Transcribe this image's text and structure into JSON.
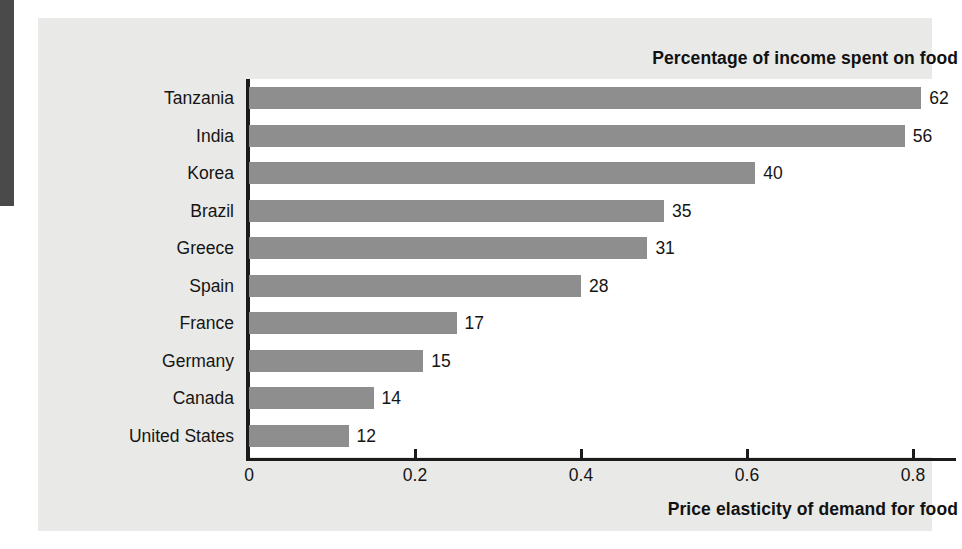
{
  "figure": {
    "header_title": "Percentage of income spent on food",
    "x_axis_title": "Price elasticity of demand for food"
  },
  "colors": {
    "bar": "#8e8e8e",
    "card_background": "#e9e9e7",
    "plot_background": "#ffffff",
    "axis": "#1b1b1b",
    "text": "#151515",
    "gutter_band": "#4a4a4a"
  },
  "chart_data": {
    "type": "bar",
    "orientation": "horizontal",
    "title": "Percentage of income spent on food",
    "xlabel": "Price elasticity of demand for food",
    "ylabel": "",
    "xlim": [
      0,
      0.88
    ],
    "grid": false,
    "legend": "none",
    "categories": [
      "Tanzania",
      "India",
      "Korea",
      "Brazil",
      "Greece",
      "Spain",
      "France",
      "Germany",
      "Canada",
      "United States"
    ],
    "series": [
      {
        "name": "Price elasticity of demand for food",
        "values": [
          0.81,
          0.79,
          0.61,
          0.5,
          0.48,
          0.4,
          0.25,
          0.21,
          0.15,
          0.12
        ]
      }
    ],
    "data_labels": [
      "62",
      "56",
      "40",
      "35",
      "31",
      "28",
      "17",
      "15",
      "14",
      "12"
    ],
    "data_label_meaning": "Percentage of income spent on food",
    "xticks": [
      0,
      0.2,
      0.4,
      0.6,
      0.8
    ],
    "xticklabels": [
      "0",
      "0.2",
      "0.4",
      "0.6",
      "0.8"
    ],
    "rows": [
      {
        "category": "Tanzania",
        "elasticity": 0.81,
        "percent_label": "62"
      },
      {
        "category": "India",
        "elasticity": 0.79,
        "percent_label": "56"
      },
      {
        "category": "Korea",
        "elasticity": 0.61,
        "percent_label": "40"
      },
      {
        "category": "Brazil",
        "elasticity": 0.5,
        "percent_label": "35"
      },
      {
        "category": "Greece",
        "elasticity": 0.48,
        "percent_label": "31"
      },
      {
        "category": "Spain",
        "elasticity": 0.4,
        "percent_label": "28"
      },
      {
        "category": "France",
        "elasticity": 0.25,
        "percent_label": "17"
      },
      {
        "category": "Germany",
        "elasticity": 0.21,
        "percent_label": "15"
      },
      {
        "category": "Canada",
        "elasticity": 0.15,
        "percent_label": "14"
      },
      {
        "category": "United States",
        "elasticity": 0.12,
        "percent_label": "12"
      }
    ]
  }
}
